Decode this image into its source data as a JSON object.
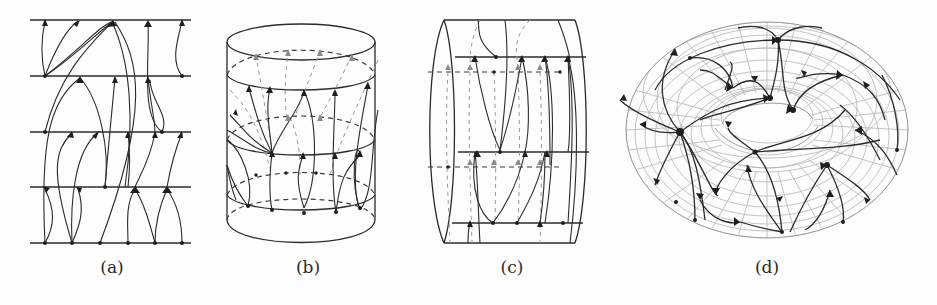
{
  "figure": {
    "panels": [
      {
        "id": "a",
        "caption": "(a)",
        "description": "Vector field lines between five horizontal parallel lines (planar strip)"
      },
      {
        "id": "b",
        "caption": "(b)",
        "description": "Vector field lines drawn on an upright cylinder with front solid and back dashed circles"
      },
      {
        "id": "c",
        "caption": "(c)",
        "description": "Vector field lines on a horizontal cylinder viewed from the side"
      },
      {
        "id": "d",
        "caption": "(d)",
        "description": "Vector field lines with arrows and singular points on a gridded torus"
      }
    ]
  }
}
